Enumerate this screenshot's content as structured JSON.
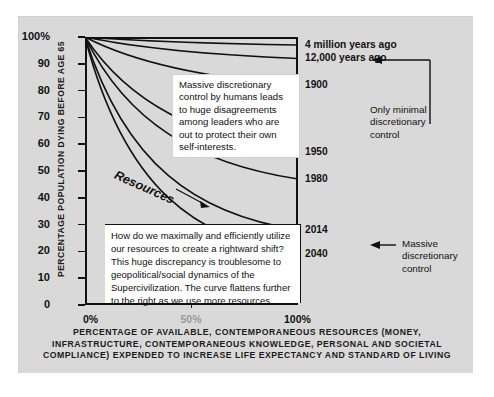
{
  "chart_data": {
    "type": "line",
    "title": "",
    "xlabel": "PERCENTAGE OF AVAILABLE, CONTEMPORANEOUS RESOURCES (MONEY, INFRASTRUCTURE, CONTEMPORANEOUS KNOWLEDGE, PERSONAL AND SOCIETAL COMPLIANCE) EXPENDED TO INCREASE LIFE EXPECTANCY AND STANDARD OF LIVING",
    "ylabel": "PERCENTAGE POPULATION DYING BEFORE AGE 65",
    "xlim": [
      0,
      100
    ],
    "ylim": [
      0,
      100
    ],
    "grid": false,
    "legend_position": "right-axis-labels",
    "x_tick_labels": [
      "0%",
      "50%",
      "100%"
    ],
    "x_tick_values": [
      0,
      50,
      100
    ],
    "y_tick_labels": [
      "0",
      "10",
      "20",
      "30",
      "40",
      "50",
      "60",
      "70",
      "80",
      "90",
      "100%"
    ],
    "y_tick_values": [
      0,
      10,
      20,
      30,
      40,
      50,
      60,
      70,
      80,
      90,
      100
    ],
    "series": [
      {
        "name": "4 million years ago",
        "end_value": 97,
        "curvature": 0.04
      },
      {
        "name": "12,000 years ago",
        "end_value": 92,
        "curvature": 0.1
      },
      {
        "name": "1900",
        "end_value": 82,
        "curvature": 0.22
      },
      {
        "name": "1950",
        "end_value": 57,
        "curvature": 0.48
      },
      {
        "name": "1980",
        "end_value": 47,
        "curvature": 0.6
      },
      {
        "name": "2014",
        "end_value": 28,
        "curvature": 0.8
      },
      {
        "name": "2040",
        "end_value": 19,
        "curvature": 0.92
      }
    ],
    "start_point": {
      "x": 0,
      "y": 100
    },
    "annotations": [
      "Massive discretionary control by humans leads to huge disagreements among leaders who are out to protect their own self-interests.",
      "How do we maximally and efficiently utilize our resources to create a rightward shift? This huge discrepancy is troublesome to geopolitical/social dynamics of the Supercivilization. The curve flattens further to the right as we use more resources.",
      "Only minimal discretionary control",
      "Massive discretionary control",
      "Resources"
    ]
  },
  "axes": {
    "y_title": "PERCENTAGE POPULATION DYING BEFORE AGE 65",
    "y_ticks": [
      {
        "label": "100%",
        "value": 100
      },
      {
        "label": "90",
        "value": 90
      },
      {
        "label": "80",
        "value": 80
      },
      {
        "label": "70",
        "value": 70
      },
      {
        "label": "60",
        "value": 60
      },
      {
        "label": "50",
        "value": 50
      },
      {
        "label": "40",
        "value": 40
      },
      {
        "label": "30",
        "value": 30
      },
      {
        "label": "20",
        "value": 20
      },
      {
        "label": "10",
        "value": 10
      },
      {
        "label": "0",
        "value": 0
      }
    ],
    "x_ticks": [
      {
        "label": "0%",
        "value": 0
      },
      {
        "label": "50%",
        "value": 50
      },
      {
        "label": "100%",
        "value": 100
      }
    ]
  },
  "curve_labels": [
    {
      "text": "4 million years ago",
      "value": 97
    },
    {
      "text": "12,000 years ago",
      "value": 92
    },
    {
      "text": "1900",
      "value": 82
    },
    {
      "text": "1950",
      "value": 57
    },
    {
      "text": "1980",
      "value": 47
    },
    {
      "text": "2014",
      "value": 28
    },
    {
      "text": "2040",
      "value": 19
    }
  ],
  "callouts": {
    "top": "Massive discretionary control by humans leads to huge disagreements among leaders who are out to protect their own self-interests.",
    "bottom": "How do we maximally and efficiently utilize our resources to create a rightward shift? This huge discrepancy is troublesome to geopolitical/social dynamics of the Supercivilization. The curve flattens further to the right as we use more resources."
  },
  "side_annotations": {
    "top": "Only minimal\ndiscretionary\ncontrol",
    "bottom": "Massive\ndiscretionary\ncontrol"
  },
  "resources_label": "Resources",
  "caption": "PERCENTAGE OF AVAILABLE, CONTEMPORANEOUS RESOURCES\n(MONEY, INFRASTRUCTURE, CONTEMPORANEOUS KNOWLEDGE,\nPERSONAL AND SOCIETAL COMPLIANCE) EXPENDED TO\nINCREASE LIFE EXPECTANCY AND STANDARD OF LIVING",
  "colors": {
    "panel_background": "#d9d9d9",
    "page_background": "#ffffff",
    "axis": "#111111",
    "curve": "#111111",
    "callout_background": "#ffffff",
    "faded_tick": "#9a9a9a"
  }
}
